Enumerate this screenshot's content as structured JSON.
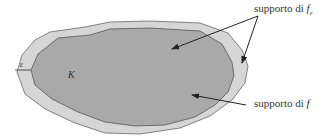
{
  "diagram": {
    "labels": {
      "support_feps_prefix": "supporto di ",
      "support_feps_var": "f",
      "support_feps_sub": "ε",
      "support_f_prefix": "supporto di ",
      "support_f_var": "f",
      "set_K": "K",
      "epsilon": "ε"
    },
    "colors": {
      "outer_fill": "#d6d6d6",
      "inner_fill": "#a9a9a9",
      "stroke": "#555555",
      "arrow": "#222222"
    }
  }
}
